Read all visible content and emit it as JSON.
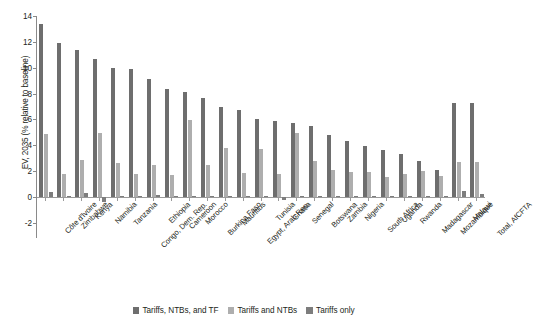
{
  "chart_data": {
    "type": "bar",
    "title": "",
    "xlabel": "",
    "ylabel": "EV, 2035 (% relative to baseline)",
    "ylim": [
      -2,
      14
    ],
    "yticks": [
      -2,
      0,
      2,
      4,
      6,
      8,
      10,
      12,
      14
    ],
    "grid": false,
    "legend_position": "bottom-center",
    "categories": [
      "Côte d'Ivoire",
      "Zimbabwe",
      "Kenya",
      "Namibia",
      "Tanzania",
      "Congo, Dem. Rep.",
      "Ethiopia",
      "Cameroon",
      "Morocco",
      "Burkina Faso",
      "Mauritius",
      "Egypt, Arab Rep.",
      "Tunisia",
      "Ghana",
      "Senegal",
      "Botswana",
      "Zambia",
      "Nigeria",
      "South Africa",
      "Uganda",
      "Rwanda",
      "Madagascar",
      "Mozambique",
      "Malawi",
      "Total, AfCFTA"
    ],
    "series": [
      {
        "name": "Tariffs, NTBs, and TF",
        "color": "#6e6e6e",
        "values": [
          13.4,
          11.9,
          11.35,
          10.65,
          9.95,
          9.9,
          9.1,
          8.35,
          8.1,
          7.65,
          6.95,
          6.75,
          6.05,
          5.85,
          5.75,
          5.5,
          4.8,
          4.35,
          3.95,
          3.65,
          3.35,
          2.75,
          2.1,
          7.25,
          7.25
        ]
      },
      {
        "name": "Tariffs and NTBs",
        "color": "#aeaeae",
        "values": [
          4.85,
          1.75,
          2.85,
          4.95,
          2.65,
          1.8,
          2.5,
          1.7,
          5.95,
          2.5,
          3.8,
          1.85,
          3.7,
          1.8,
          4.95,
          2.8,
          2.1,
          1.9,
          1.95,
          1.55,
          1.8,
          2.0,
          1.6,
          2.7,
          2.7
        ]
      },
      {
        "name": "Tariffs only",
        "color": "#7d7d7d",
        "values": [
          0.4,
          0.1,
          0.3,
          -0.35,
          0.1,
          0.1,
          0.15,
          0.1,
          0.1,
          0.1,
          0.1,
          0.1,
          0.1,
          -0.25,
          0.1,
          0.1,
          0.1,
          0.1,
          0.1,
          0.1,
          0.1,
          0.1,
          0.1,
          0.45,
          0.2
        ]
      }
    ]
  },
  "legend": {
    "items": [
      {
        "label": "Tariffs, NTBs, and TF",
        "color": "#6e6e6e"
      },
      {
        "label": "Tariffs and NTBs",
        "color": "#aeaeae"
      },
      {
        "label": "Tariffs only",
        "color": "#7d7d7d"
      }
    ]
  }
}
